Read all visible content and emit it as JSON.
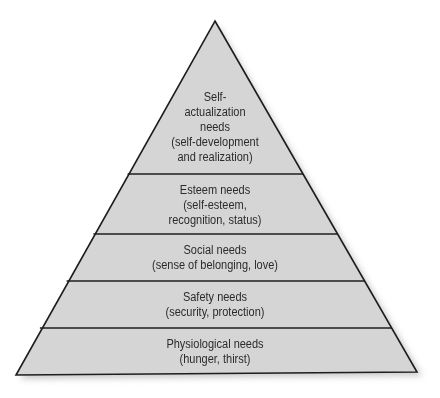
{
  "diagram": {
    "type": "pyramid",
    "colors": {
      "fill": "#d5d5d5",
      "stroke": "#1e1e1e",
      "text": "#2b2b2b",
      "shadow": "#bdbdbd"
    },
    "levels": [
      {
        "id": "self-actualization",
        "lines": [
          "Self-",
          "actualization",
          "needs",
          "(self-development",
          "and realization)"
        ]
      },
      {
        "id": "esteem",
        "lines": [
          "Esteem needs",
          "(self-esteem,",
          "recognition, status)"
        ]
      },
      {
        "id": "social",
        "lines": [
          "Social needs",
          "(sense of belonging, love)"
        ]
      },
      {
        "id": "safety",
        "lines": [
          "Safety needs",
          "(security, protection)"
        ]
      },
      {
        "id": "physiological",
        "lines": [
          "Physiological needs",
          "(hunger, thirst)"
        ]
      }
    ]
  }
}
